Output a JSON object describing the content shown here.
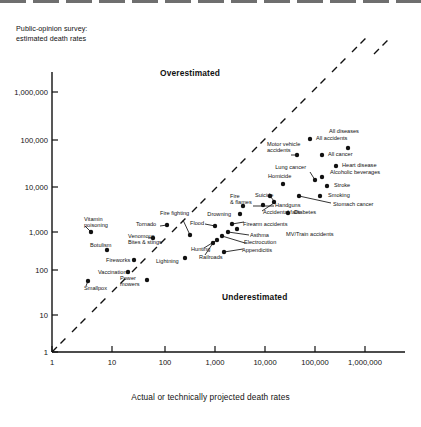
{
  "figure": {
    "y_axis_title": "Public-opinion survey:\nestimated death rates",
    "x_axis_title": "Actual or technically projected death rates",
    "overestimated_label": "Overestimated",
    "underestimated_label": "Underestimated"
  },
  "chart_data": {
    "type": "scatter",
    "title": "",
    "xlabel": "Actual or technically projected death rates",
    "ylabel": "Public-opinion survey: estimated death rates",
    "xscale": "log",
    "yscale": "log",
    "xlim": [
      1,
      10000000
    ],
    "ylim": [
      1,
      3000000
    ],
    "grid": false,
    "legend": "none",
    "xticks": [
      "1",
      "10",
      "100",
      "1,000",
      "10,000",
      "100,000",
      "1,000,000"
    ],
    "yticks": [
      "1",
      "10",
      "100",
      "1,000",
      "10,000",
      "100,000",
      "1,000,000"
    ],
    "annotations": [
      {
        "text": "Overestimated",
        "x": 300,
        "y": 900000
      },
      {
        "text": "Underestimated",
        "x": 70000,
        "y": 40
      }
    ],
    "reference_line": {
      "label": "identity line (estimate = actual)",
      "style": "dashed",
      "from": [
        1,
        1
      ],
      "to": [
        10000000,
        10000000
      ]
    },
    "points": [
      {
        "label": "All diseases",
        "actual": 900000,
        "estimated": 60000
      },
      {
        "label": "All accidents",
        "actual": 120000,
        "estimated": 95000
      },
      {
        "label": "Motor vehicle accidents",
        "actual": 55000,
        "estimated": 45000
      },
      {
        "label": "All cancer",
        "actual": 330000,
        "estimated": 40000
      },
      {
        "label": "Heart disease",
        "actual": 740000,
        "estimated": 22000
      },
      {
        "label": "Lung cancer",
        "actual": 75000,
        "estimated": 12000
      },
      {
        "label": "Alcoholic beverages",
        "actual": 100000,
        "estimated": 12000
      },
      {
        "label": "Stroke",
        "actual": 210000,
        "estimated": 8500
      },
      {
        "label": "Homicide",
        "actual": 19000,
        "estimated": 8000
      },
      {
        "label": "Smoking",
        "actual": 150000,
        "estimated": 4000
      },
      {
        "label": "Stomach cancer",
        "actual": 95000,
        "estimated": 3000
      },
      {
        "label": "Handguns",
        "actual": 17000,
        "estimated": 3000
      },
      {
        "label": "Suicide",
        "actual": 27000,
        "estimated": 4500
      },
      {
        "label": "Accidental falls",
        "actual": 17000,
        "estimated": 2200
      },
      {
        "label": "Diabetes",
        "actual": 39000,
        "estimated": 1600
      },
      {
        "label": "Fire & flames",
        "actual": 7000,
        "estimated": 3500
      },
      {
        "label": "Drowning",
        "actual": 6000,
        "estimated": 1800
      },
      {
        "label": "Firearm accidents",
        "actual": 2500,
        "estimated": 1100
      },
      {
        "label": "Asthma",
        "actual": 1900,
        "estimated": 900
      },
      {
        "label": "MV/Train accidents",
        "actual": 1600,
        "estimated": 800
      },
      {
        "label": "Electrocution",
        "actual": 900,
        "estimated": 600
      },
      {
        "label": "Appendicitis",
        "actual": 900,
        "estimated": 300
      },
      {
        "label": "Railroads",
        "actual": 500,
        "estimated": 220
      },
      {
        "label": "Hunting",
        "actual": 800,
        "estimated": 400
      },
      {
        "label": "Flood",
        "actual": 100,
        "estimated": 800
      },
      {
        "label": "Tornado",
        "actual": 90,
        "estimated": 700
      },
      {
        "label": "Fire fighting",
        "actual": 200,
        "estimated": 550
      },
      {
        "label": "Venomous bites & stings",
        "actual": 50,
        "estimated": 350
      },
      {
        "label": "Botulism",
        "actual": 2,
        "estimated": 250
      },
      {
        "label": "Vitamin poisoning",
        "actual": 1,
        "estimated": 900
      },
      {
        "label": "Fireworks",
        "actual": 7,
        "estimated": 130
      },
      {
        "label": "Lightning",
        "actual": 50,
        "estimated": 140
      },
      {
        "label": "Vaccinations",
        "actual": 10,
        "estimated": 80
      },
      {
        "label": "Power mowers",
        "actual": 30,
        "estimated": 70
      },
      {
        "label": "Smallpox",
        "actual": 1,
        "estimated": 60
      }
    ]
  },
  "points_px": [
    {
      "name": "all-diseases",
      "x": 348,
      "y": 148,
      "lx": 344,
      "ly": 131,
      "align": "center",
      "text": "All diseases"
    },
    {
      "name": "all-accidents",
      "x": 310,
      "y": 139,
      "lx": 316,
      "ly": 138,
      "align": "left",
      "text": "All accidents"
    },
    {
      "name": "motor-vehicle",
      "x": 297,
      "y": 155,
      "lx": 267,
      "ly": 144,
      "align": "left",
      "text": "Motor vehicle\naccidents"
    },
    {
      "name": "all-cancer",
      "x": 322,
      "y": 155,
      "lx": 328,
      "ly": 154,
      "align": "left",
      "text": "All cancer"
    },
    {
      "name": "heart-disease",
      "x": 336,
      "y": 166,
      "lx": 342,
      "ly": 165,
      "align": "left",
      "text": "Heart disease"
    },
    {
      "name": "lung-cancer",
      "x": 315,
      "y": 180,
      "lx": 306,
      "ly": 167,
      "align": "right",
      "text": "Lung cancer"
    },
    {
      "name": "alcoholic-beverages",
      "x": 322,
      "y": 177,
      "lx": 330,
      "ly": 172,
      "align": "left",
      "text": "Alcoholic beverages"
    },
    {
      "name": "stroke",
      "x": 327,
      "y": 186,
      "lx": 334,
      "ly": 185,
      "align": "left",
      "text": "Stroke"
    },
    {
      "name": "homicide",
      "x": 283,
      "y": 184,
      "lx": 268,
      "ly": 176,
      "align": "left",
      "text": "Homicide"
    },
    {
      "name": "smoking",
      "x": 320,
      "y": 196,
      "lx": 328,
      "ly": 195,
      "align": "left",
      "text": "Smoking"
    },
    {
      "name": "stomach-cancer",
      "x": 299,
      "y": 196,
      "lx": 333,
      "ly": 204,
      "align": "left",
      "text": "Stomach cancer"
    },
    {
      "name": "handguns",
      "x": 263,
      "y": 205,
      "lx": 275,
      "ly": 205,
      "align": "left",
      "text": "Handguns"
    },
    {
      "name": "suicide",
      "x": 270,
      "y": 196,
      "lx": 255,
      "ly": 195,
      "align": "left",
      "text": "Suicide"
    },
    {
      "name": "accidental-falls",
      "x": 274,
      "y": 202,
      "lx": 263,
      "ly": 212,
      "align": "left",
      "text": "Accidental falls"
    },
    {
      "name": "diabetes",
      "x": 288,
      "y": 213,
      "lx": 294,
      "ly": 212,
      "align": "left",
      "text": "Diabetes"
    },
    {
      "name": "fire-flames",
      "x": 243,
      "y": 206,
      "lx": 230,
      "ly": 196,
      "align": "left",
      "text": "Fire\n& flames"
    },
    {
      "name": "drowning",
      "x": 240,
      "y": 214,
      "lx": 231,
      "ly": 214,
      "align": "right",
      "text": "Drowning"
    },
    {
      "name": "firearm-accidents",
      "x": 232,
      "y": 224,
      "lx": 243,
      "ly": 224,
      "align": "left",
      "text": "Firearm accidents"
    },
    {
      "name": "asthma",
      "x": 228,
      "y": 232,
      "lx": 250,
      "ly": 235,
      "align": "left",
      "text": "Asthma"
    },
    {
      "name": "mv-train",
      "x": 237,
      "y": 229,
      "lx": 286,
      "ly": 234,
      "align": "left",
      "text": "MV/Train accidents"
    },
    {
      "name": "electrocution",
      "x": 222,
      "y": 236,
      "lx": 244,
      "ly": 242,
      "align": "left",
      "text": "Electrocution"
    },
    {
      "name": "appendicitis",
      "x": 224,
      "y": 252,
      "lx": 242,
      "ly": 250,
      "align": "left",
      "text": "Appendicitis"
    },
    {
      "name": "railroads",
      "x": 213,
      "y": 243,
      "lx": 199,
      "ly": 257,
      "align": "left",
      "text": "Railroads"
    },
    {
      "name": "hunting",
      "x": 217,
      "y": 240,
      "lx": 191,
      "ly": 249,
      "align": "left",
      "text": "Hunting"
    },
    {
      "name": "flood",
      "x": 215,
      "y": 226,
      "lx": 190,
      "ly": 223,
      "align": "left",
      "text": "Flood"
    },
    {
      "name": "tornado",
      "x": 167,
      "y": 225,
      "lx": 136,
      "ly": 224,
      "align": "left",
      "text": "Tornado"
    },
    {
      "name": "fire-fighting",
      "x": 190,
      "y": 235,
      "lx": 160,
      "ly": 213,
      "align": "left",
      "text": "Fire fighting"
    },
    {
      "name": "venomous-bites",
      "x": 153,
      "y": 238,
      "lx": 128,
      "ly": 236,
      "align": "left",
      "text": "Venomous\nBites & stings"
    },
    {
      "name": "botulism",
      "x": 107,
      "y": 250,
      "lx": 90,
      "ly": 245,
      "align": "left",
      "text": "Botulism"
    },
    {
      "name": "vitamin-poisoning",
      "x": 91,
      "y": 232,
      "lx": 84,
      "ly": 219,
      "align": "left",
      "text": "Vitamin\npoisoning"
    },
    {
      "name": "fireworks",
      "x": 134,
      "y": 260,
      "lx": 106,
      "ly": 260,
      "align": "left",
      "text": "Fireworks"
    },
    {
      "name": "lightning",
      "x": 185,
      "y": 258,
      "lx": 156,
      "ly": 261,
      "align": "left",
      "text": "Lightning"
    },
    {
      "name": "vaccinations",
      "x": 128,
      "y": 272,
      "lx": 98,
      "ly": 272,
      "align": "left",
      "text": "Vaccinations"
    },
    {
      "name": "power-mowers",
      "x": 147,
      "y": 280,
      "lx": 120,
      "ly": 278,
      "align": "left",
      "text": "Power\nmowers"
    },
    {
      "name": "smallpox",
      "x": 88,
      "y": 281,
      "lx": 84,
      "ly": 288,
      "align": "left",
      "text": "Smallpox"
    }
  ],
  "leaders": [
    {
      "name": "leader-motor-vehicle",
      "x1": 291,
      "y1": 155,
      "x2": 297,
      "y2": 155
    },
    {
      "name": "leader-lung-cancer",
      "x1": 310,
      "y1": 172,
      "x2": 315,
      "y2": 180
    },
    {
      "name": "leader-stomach-cancer",
      "x1": 299,
      "y1": 196,
      "x2": 331,
      "y2": 203
    },
    {
      "name": "leader-handguns",
      "x1": 253,
      "y1": 206,
      "x2": 274,
      "y2": 206
    },
    {
      "name": "leader-suicide",
      "x1": 270,
      "y1": 196,
      "x2": 274,
      "y2": 201
    },
    {
      "name": "leader-accidental-falls",
      "x1": 262,
      "y1": 211,
      "x2": 274,
      "y2": 203
    },
    {
      "name": "leader-firearm-acc",
      "x1": 232,
      "y1": 224,
      "x2": 244,
      "y2": 222
    },
    {
      "name": "leader-asthma",
      "x1": 228,
      "y1": 232,
      "x2": 249,
      "y2": 235
    },
    {
      "name": "leader-electro",
      "x1": 222,
      "y1": 236,
      "x2": 245,
      "y2": 243
    },
    {
      "name": "leader-appendicitis",
      "x1": 224,
      "y1": 252,
      "x2": 243,
      "y2": 249
    },
    {
      "name": "leader-railroads",
      "x1": 213,
      "y1": 243,
      "x2": 205,
      "y2": 255
    },
    {
      "name": "leader-hunting",
      "x1": 217,
      "y1": 240,
      "x2": 204,
      "y2": 248
    },
    {
      "name": "leader-fire-fighting",
      "x1": 190,
      "y1": 235,
      "x2": 183,
      "y2": 220
    },
    {
      "name": "leader-tornado",
      "x1": 167,
      "y1": 225,
      "x2": 160,
      "y2": 226
    },
    {
      "name": "leader-flood",
      "x1": 215,
      "y1": 226,
      "x2": 205,
      "y2": 224
    },
    {
      "name": "leader-venomous",
      "x1": 153,
      "y1": 238,
      "x2": 148,
      "y2": 238
    },
    {
      "name": "leader-vitamin",
      "x1": 91,
      "y1": 232,
      "x2": 85,
      "y2": 226
    },
    {
      "name": "leader-smallpox",
      "x1": 88,
      "y1": 281,
      "x2": 86,
      "y2": 286
    }
  ],
  "dashes": [
    {
      "name": "dash-1",
      "x1": 52,
      "y1": 352,
      "x2": 66,
      "y2": 338
    },
    {
      "name": "dash-2",
      "x1": 72,
      "y1": 332,
      "x2": 86,
      "y2": 318
    },
    {
      "name": "dash-3",
      "x1": 92,
      "y1": 312,
      "x2": 106,
      "y2": 298
    },
    {
      "name": "dash-4",
      "x1": 112,
      "y1": 292,
      "x2": 126,
      "y2": 278
    },
    {
      "name": "dash-5",
      "x1": 132,
      "y1": 272,
      "x2": 146,
      "y2": 258
    },
    {
      "name": "dash-6",
      "x1": 152,
      "y1": 252,
      "x2": 166,
      "y2": 238
    },
    {
      "name": "dash-7",
      "x1": 172,
      "y1": 232,
      "x2": 186,
      "y2": 218
    },
    {
      "name": "dash-8",
      "x1": 192,
      "y1": 212,
      "x2": 206,
      "y2": 198
    },
    {
      "name": "dash-9",
      "x1": 212,
      "y1": 192,
      "x2": 226,
      "y2": 178
    },
    {
      "name": "dash-10",
      "x1": 232,
      "y1": 172,
      "x2": 246,
      "y2": 158
    },
    {
      "name": "dash-11",
      "x1": 252,
      "y1": 152,
      "x2": 266,
      "y2": 138
    },
    {
      "name": "dash-12",
      "x1": 272,
      "y1": 132,
      "x2": 286,
      "y2": 118
    },
    {
      "name": "dash-13",
      "x1": 292,
      "y1": 112,
      "x2": 306,
      "y2": 98
    },
    {
      "name": "dash-14",
      "x1": 312,
      "y1": 92,
      "x2": 326,
      "y2": 78
    },
    {
      "name": "dash-15",
      "x1": 332,
      "y1": 72,
      "x2": 346,
      "y2": 58
    },
    {
      "name": "dash-16",
      "x1": 352,
      "y1": 52,
      "x2": 366,
      "y2": 38
    },
    {
      "name": "dash-17",
      "x1": 374,
      "y1": 54,
      "x2": 388,
      "y2": 40
    }
  ],
  "yticks_px": [
    {
      "label": "1,000,000",
      "y": 92
    },
    {
      "label": "100,000",
      "y": 140
    },
    {
      "label": "10,000",
      "y": 187
    },
    {
      "label": "1,000",
      "y": 232
    },
    {
      "label": "100",
      "y": 270
    },
    {
      "label": "10",
      "y": 315
    },
    {
      "label": "1",
      "y": 352
    }
  ],
  "xticks_px": [
    {
      "label": "1",
      "x": 52
    },
    {
      "label": "10",
      "x": 112
    },
    {
      "label": "100",
      "x": 165
    },
    {
      "label": "1,000",
      "x": 215
    },
    {
      "label": "10,000",
      "x": 265
    },
    {
      "label": "100,000",
      "x": 315
    },
    {
      "label": "1,000,000",
      "x": 365
    }
  ]
}
